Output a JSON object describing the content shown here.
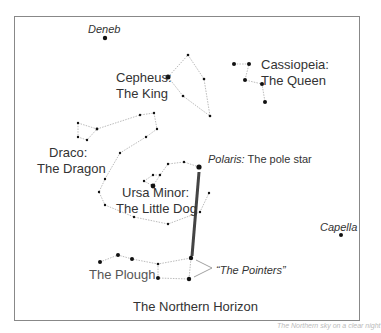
{
  "labels": {
    "deneb": "Deneb",
    "cepheus_1": "Cepheus:",
    "cepheus_2": "The King",
    "cassiopeia_1": "Cassiopeia:",
    "cassiopeia_2": "The Queen",
    "draco_1": "Draco:",
    "draco_2": "The Dragon",
    "polaris_name": "Polaris:",
    "polaris_desc": " The pole star",
    "ursa_minor_1": "Ursa Minor:",
    "ursa_minor_2": "The Little Dog",
    "capella": "Capella",
    "plough": "The Plough",
    "pointers": "“The Pointers”",
    "horizon": "The Northern Horizon",
    "caption": "The Northern sky on a clear night"
  },
  "colors": {
    "line": "#aaaaaa",
    "star": "#111111",
    "pointer_line": "#444444",
    "frame": "#888888"
  }
}
